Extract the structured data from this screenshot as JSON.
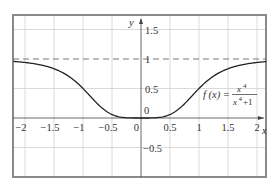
{
  "chart_data": {
    "type": "line",
    "title": "",
    "xlabel": "x",
    "ylabel": "y",
    "xlim": [
      -2.2,
      2.2
    ],
    "ylim": [
      -0.85,
      1.7
    ],
    "grid": true,
    "x_ticks": [
      -2,
      -1.5,
      -1,
      -0.5,
      0,
      0.5,
      1,
      1.5,
      2
    ],
    "x_tick_labels": [
      "−2",
      "−1.5",
      "−1",
      "−0.5",
      "0",
      "0.5",
      "1",
      "1.5",
      "2"
    ],
    "y_ticks": [
      -0.5,
      0,
      0.5,
      1,
      1.5
    ],
    "y_tick_labels": [
      "−0.5",
      "0",
      "0.5",
      "1",
      "1.5"
    ],
    "series": [
      {
        "name": "f(x) = x^4/(x^4+1)",
        "style": "solid",
        "color": "#222222",
        "x": [
          -2.2,
          -2,
          -1.75,
          -1.5,
          -1.25,
          -1,
          -0.75,
          -0.5,
          -0.25,
          0,
          0.25,
          0.5,
          0.75,
          1,
          1.25,
          1.5,
          1.75,
          2,
          2.2
        ],
        "y": [
          0.959,
          0.941,
          0.904,
          0.835,
          0.709,
          0.5,
          0.24,
          0.059,
          0.004,
          0,
          0.004,
          0.059,
          0.24,
          0.5,
          0.709,
          0.835,
          0.904,
          0.941,
          0.959
        ]
      },
      {
        "name": "asymptote y = 1",
        "style": "dashed",
        "color": "#555555",
        "x": [
          -2.2,
          2.2
        ],
        "y": [
          1,
          1
        ]
      }
    ],
    "annotations": [
      {
        "text": "f(x) = x⁴/(x⁴+1)",
        "x": 1.3,
        "y": 0.33
      },
      {
        "text": "0",
        "x": 0.05,
        "y": 0.06,
        "note": "origin label above axis"
      }
    ]
  },
  "labels": {
    "y_axis": "y",
    "x_axis": "x",
    "origin_upper": "0",
    "formula_lhs": "f (x) =",
    "formula_num": "x",
    "formula_num_exp": "4",
    "formula_den": "x",
    "formula_den_exp": "4",
    "formula_den_tail": "+1"
  },
  "colors": {
    "frame": "#8a8a8a",
    "grid": "#d0d0d0",
    "axis": "#444444",
    "curve": "#222222",
    "dash": "#666666"
  }
}
